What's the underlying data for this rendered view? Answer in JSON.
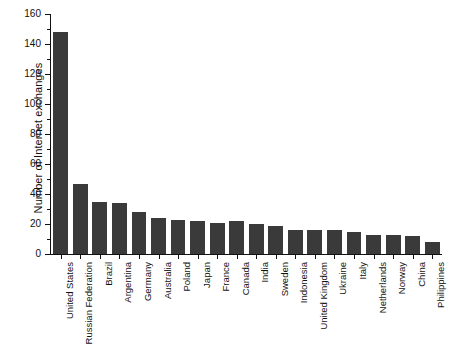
{
  "chart_data": {
    "type": "bar",
    "title": "",
    "xlabel": "",
    "ylabel": "Number of Internet exchanges",
    "ylim": [
      0,
      160
    ],
    "ytick_values": [
      0,
      20,
      40,
      60,
      80,
      100,
      120,
      140,
      160
    ],
    "ytick_labels": [
      "0",
      "20",
      "40",
      "60",
      "80",
      "100",
      "120",
      "140",
      "160"
    ],
    "yminor_values": [
      10,
      30,
      50,
      70,
      90,
      110,
      130,
      150
    ],
    "grid": false,
    "legend": "none",
    "bar_color": "#3a3a3a",
    "axis_color": "#111111",
    "background": "#ffffff",
    "categories": [
      "United States",
      "Russian Federation",
      "Brazil",
      "Argentina",
      "Germany",
      "Australia",
      "Poland",
      "Japan",
      "France",
      "Canada",
      "India",
      "Sweden",
      "Indonesia",
      "United Kingdom",
      "Ukraine",
      "Italy",
      "Netherlands",
      "Norway",
      "China",
      "Philippines"
    ],
    "values": [
      148,
      47,
      35,
      34,
      28,
      24,
      23,
      22,
      21,
      22,
      20,
      19,
      16,
      16,
      16,
      15,
      13,
      13,
      12,
      8
    ]
  }
}
